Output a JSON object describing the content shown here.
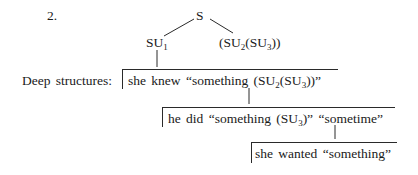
{
  "example_number": "2.",
  "tree": {
    "root": "S",
    "left_child": {
      "base": "SU",
      "sub": "1"
    },
    "right_child": {
      "open": "(SU",
      "sub1": "2",
      "mid": "(SU",
      "sub2": "3",
      "close": "))"
    }
  },
  "deep_structures_label": "Deep structures:",
  "structures": [
    {
      "pre": "she knew “something (SU",
      "sub1": "2",
      "mid": "(SU",
      "sub2": "3",
      "post": "))”"
    },
    {
      "pre": "he did “something (SU",
      "sub1": "3",
      "post": ")” “sometime”"
    },
    {
      "text": "she wanted “something”"
    }
  ]
}
